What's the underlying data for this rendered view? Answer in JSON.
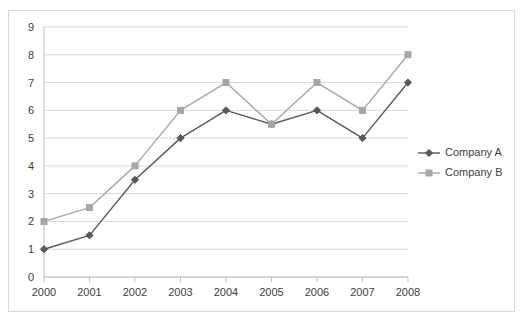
{
  "chart_data": {
    "type": "line",
    "title": "",
    "subtitle": "",
    "xlabel": "",
    "ylabel": "",
    "categories": [
      "2000",
      "2001",
      "2002",
      "2003",
      "2004",
      "2005",
      "2006",
      "2007",
      "2008"
    ],
    "series": [
      {
        "name": "Company A",
        "values": [
          1,
          1.5,
          3.5,
          5,
          6,
          5.5,
          6,
          5,
          7
        ],
        "color": "#595959",
        "marker": "diamond"
      },
      {
        "name": "Company B",
        "values": [
          2,
          2.5,
          4,
          6,
          7,
          5.5,
          7,
          6,
          8
        ],
        "color": "#a6a6a6",
        "marker": "square"
      }
    ],
    "ylim": [
      0,
      9
    ],
    "y_ticks": [
      "0",
      "1",
      "2",
      "3",
      "4",
      "5",
      "6",
      "7",
      "8",
      "9"
    ],
    "grid": true,
    "grid_color": "#d9d9d9",
    "legend_position": "right",
    "plot_background": "#ffffff",
    "border_color": "#d9d9d9"
  },
  "legend": {
    "entries": [
      {
        "label": "Company A"
      },
      {
        "label": "Company B"
      }
    ]
  }
}
